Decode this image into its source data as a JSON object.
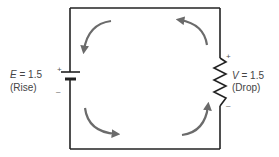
{
  "source": {
    "symbol": "E",
    "equals": "=",
    "value": "1.5",
    "note": "(Rise)",
    "plus": "+",
    "minus": "–"
  },
  "load": {
    "symbol": "V",
    "equals": "=",
    "value": "1.5",
    "note": "(Drop)",
    "plus": "+",
    "minus": "–"
  },
  "colors": {
    "wire": "#222222",
    "arrow": "#6b6b6b",
    "text": "#444444"
  },
  "arrows": [
    "top-left",
    "top-right",
    "bottom-left",
    "bottom-right"
  ]
}
